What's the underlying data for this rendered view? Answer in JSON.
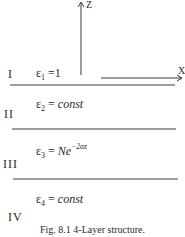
{
  "figure": {
    "caption": "Fig. 8.1  4-Layer structure.",
    "axes": {
      "z_label": "Z",
      "x_label": "X"
    },
    "layers": [
      {
        "numeral": "I",
        "eps_symbol": "ε",
        "eps_index": "1",
        "eq_sign": "=",
        "value": "1",
        "value_italic": false
      },
      {
        "numeral": "II",
        "eps_symbol": "ε",
        "eps_index": "2",
        "eq_sign": "=",
        "value": "const",
        "value_italic": true
      },
      {
        "numeral": "III",
        "eps_symbol": "ε",
        "eps_index": "3",
        "eq_sign": "=",
        "value_base": "Ne",
        "value_exponent": "−2αz"
      },
      {
        "numeral": "IV",
        "eps_symbol": "ε",
        "eps_index": "4",
        "eq_sign": "=",
        "value": "const",
        "value_italic": true
      }
    ],
    "colors": {
      "line": "#3a3a3a",
      "text": "#2a2a2a",
      "background": "#ffffff"
    }
  }
}
